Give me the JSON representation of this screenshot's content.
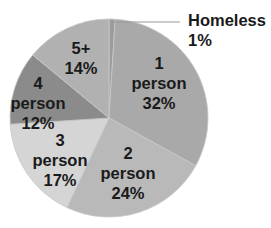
{
  "chart_data": {
    "type": "pie",
    "title": "",
    "categories": [
      "Homeless",
      "1 person",
      "2 person",
      "3 person",
      "4 person",
      "5+"
    ],
    "values": [
      1,
      32,
      24,
      17,
      12,
      14
    ],
    "unit": "%",
    "start_angle_deg": 0,
    "direction": "clockwise",
    "colors": [
      "#9c9c9c",
      "#a9a9a9",
      "#b9b9b9",
      "#d5d5d5",
      "#8b8b8b",
      "#b1b1b1"
    ],
    "legend": false,
    "slices": [
      {
        "label": "Homeless",
        "value": 1,
        "text": [
          "Homeless",
          "1%"
        ],
        "color": "#9c9c9c"
      },
      {
        "label": "1 person",
        "value": 32,
        "text": [
          "1",
          "person",
          "32%"
        ],
        "color": "#a9a9a9"
      },
      {
        "label": "2 person",
        "value": 24,
        "text": [
          "2",
          "person",
          "24%"
        ],
        "color": "#b9b9b9"
      },
      {
        "label": "3 person",
        "value": 17,
        "text": [
          "3",
          "person",
          "17%"
        ],
        "color": "#d5d5d5"
      },
      {
        "label": "4 person",
        "value": 12,
        "text": [
          "4",
          "person",
          "12%"
        ],
        "color": "#8b8b8b"
      },
      {
        "label": "5+",
        "value": 14,
        "text": [
          "5+",
          "14%"
        ],
        "color": "#b1b1b1"
      }
    ]
  },
  "layout": {
    "cx": 109,
    "cy": 118,
    "r": 99,
    "label_positions": [
      {
        "x": 188,
        "y": 26,
        "anchor": "start",
        "line_height": 20
      },
      {
        "x": 159,
        "y": 69,
        "anchor": "middle",
        "line_height": 20
      },
      {
        "x": 128,
        "y": 159,
        "anchor": "middle",
        "line_height": 20
      },
      {
        "x": 60,
        "y": 146,
        "anchor": "middle",
        "line_height": 20
      },
      {
        "x": 38,
        "y": 89,
        "anchor": "middle",
        "line_height": 20
      },
      {
        "x": 81,
        "y": 54,
        "anchor": "middle",
        "line_height": 20
      }
    ],
    "leader_line": {
      "x1": 112,
      "y1": 22,
      "x2": 180,
      "y2": 22,
      "color": "#9a9a9a"
    }
  }
}
